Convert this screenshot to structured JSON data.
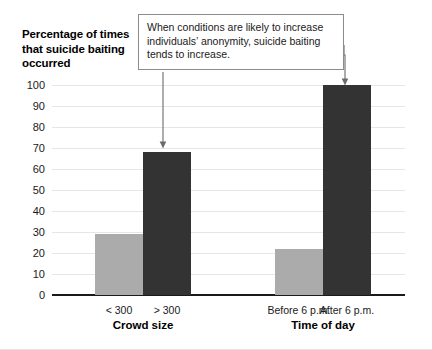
{
  "figure": {
    "background_color": "#ffffff",
    "annotation": {
      "text": "When conditions are likely to increase individuals’ anonymity, suicide baiting tends to increase.",
      "border_color": "#8c8c8c",
      "arrow_color": "#6b6b6b",
      "arrow_targets": [
        "> 300",
        "After 6 p.m."
      ]
    }
  },
  "chart_data": {
    "type": "bar",
    "title": "",
    "xlabel": "",
    "ylabel": "Percentage of times that suicide baiting occurred",
    "ylim": [
      0,
      100
    ],
    "ytick_step": 10,
    "yticks": [
      0,
      10,
      20,
      30,
      40,
      50,
      60,
      70,
      80,
      90,
      100
    ],
    "ytick_labels": [
      "0",
      "10",
      "20",
      "30",
      "40",
      "50",
      "60",
      "70",
      "80",
      "90",
      "100"
    ],
    "grid": true,
    "grid_axis": "y",
    "legend": false,
    "legend_position": "none",
    "groups": [
      {
        "label": "Crowd size",
        "categories": [
          "< 300",
          "> 300"
        ],
        "values": [
          29,
          68
        ],
        "colors": [
          "#ababab",
          "#333333"
        ]
      },
      {
        "label": "Time of day",
        "categories": [
          "Before 6 p.m.",
          "After 6 p.m."
        ],
        "values": [
          22,
          100
        ],
        "colors": [
          "#ababab",
          "#333333"
        ]
      }
    ],
    "categories": [
      "< 300",
      "> 300",
      "Before 6 p.m.",
      "After 6 p.m."
    ],
    "values": [
      29,
      68,
      22,
      100
    ],
    "colors": {
      "light_bar": "#ababab",
      "dark_bar": "#333333",
      "gridline": "#e6e6e6",
      "axis": "#1a1a1a"
    }
  }
}
